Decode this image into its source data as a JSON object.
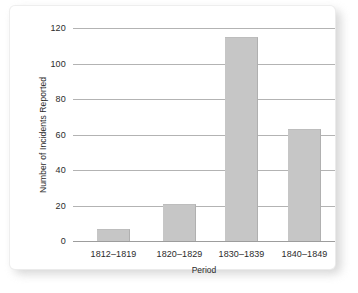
{
  "chart_data": {
    "type": "bar",
    "title": "",
    "xlabel": "Period",
    "ylabel": "Number of Incidents Reported",
    "categories": [
      "1812–1819",
      "1820–1829",
      "1830–1839",
      "1840–1849"
    ],
    "values": [
      7,
      21,
      115,
      63
    ],
    "ylim": [
      0,
      120
    ],
    "yticks": [
      0,
      20,
      40,
      60,
      80,
      100,
      120
    ],
    "ytick_labels": [
      "0",
      "20",
      "40",
      "60",
      "80",
      "100",
      "120"
    ],
    "grid": true,
    "grid_axis": "y",
    "legend": false,
    "legend_position": "none",
    "bar_color": "#c6c6c6",
    "background_color": "#ffffff",
    "axis_color": "#9d9d9d",
    "grid_color": "#b3b3b3",
    "text_color": "#2b2b2b"
  }
}
